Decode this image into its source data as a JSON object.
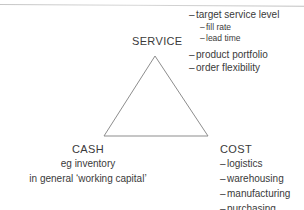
{
  "diagram": {
    "background_color": "#ffffff",
    "text_color": "#3a3a3a",
    "line_color": "#8d8d8d",
    "shape": {
      "name": "triangle",
      "apex": "155,56",
      "base_left": "104,136",
      "base_right": "208,136",
      "points": "155,56 208,136 104,136"
    },
    "service": {
      "label": "SERVICE",
      "items": [
        {
          "text": "target service level",
          "level": 1
        },
        {
          "text": "fill rate",
          "level": 2
        },
        {
          "text": "lead time",
          "level": 2
        },
        {
          "text": "product portfolio",
          "level": 1
        },
        {
          "text": "order flexibility",
          "level": 1
        }
      ]
    },
    "cash": {
      "label": "CASH",
      "lines": [
        "eg inventory",
        "in general ‘working capital’"
      ]
    },
    "cost": {
      "label": "COST",
      "items": [
        "logistics",
        "warehousing",
        "manufacturing",
        "purchasing"
      ]
    },
    "bullet_dash": "–"
  }
}
